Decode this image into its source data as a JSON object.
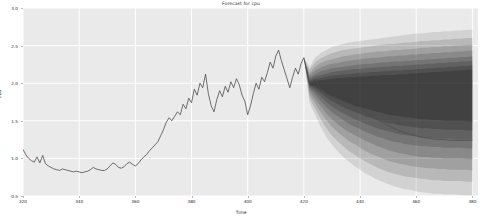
{
  "chart_data": {
    "type": "line",
    "title": "Forecast for cpu",
    "xlabel": "Time",
    "ylabel": "cpu",
    "xlim": [
      320,
      482
    ],
    "ylim": [
      0.5,
      3.0
    ],
    "xticks": [
      320,
      340,
      360,
      380,
      400,
      420,
      440,
      460,
      480
    ],
    "xticklabels": [
      "320",
      "340",
      "360",
      "380",
      "400",
      "420",
      "440",
      "460",
      "480"
    ],
    "yticks": [
      0.5,
      1.0,
      1.5,
      2.0,
      2.5,
      3.0
    ],
    "yticklabels": [
      "0.5",
      "1.0",
      "1.5",
      "2.0",
      "2.5",
      "3.0"
    ],
    "grid": true,
    "legend": "none",
    "forecast_start": 420,
    "series": [
      {
        "name": "history",
        "color": "#4d4d4d",
        "x": [
          320,
          321,
          322,
          323,
          324,
          325,
          326,
          327,
          328,
          329,
          330,
          331,
          332,
          333,
          334,
          335,
          336,
          337,
          338,
          339,
          340,
          341,
          342,
          343,
          344,
          345,
          346,
          347,
          348,
          349,
          350,
          351,
          352,
          353,
          354,
          355,
          356,
          357,
          358,
          359,
          360,
          361,
          362,
          363,
          364,
          365,
          366,
          367,
          368,
          369,
          370,
          371,
          372,
          373,
          374,
          375,
          376,
          377,
          378,
          379,
          380,
          381,
          382,
          383,
          384,
          385,
          386,
          387,
          388,
          389,
          390,
          391,
          392,
          393,
          394,
          395,
          396,
          397,
          398,
          399,
          400,
          401,
          402,
          403,
          404,
          405,
          406,
          407,
          408,
          409,
          410,
          411,
          412,
          413,
          414,
          415,
          416,
          417,
          418,
          419,
          420
        ],
        "values": [
          1.12,
          1.05,
          1.0,
          0.97,
          0.95,
          1.02,
          0.94,
          1.04,
          0.93,
          0.9,
          0.88,
          0.86,
          0.85,
          0.84,
          0.86,
          0.85,
          0.84,
          0.83,
          0.82,
          0.83,
          0.82,
          0.81,
          0.82,
          0.83,
          0.85,
          0.88,
          0.86,
          0.85,
          0.84,
          0.84,
          0.86,
          0.9,
          0.94,
          0.92,
          0.88,
          0.87,
          0.89,
          0.93,
          0.95,
          0.92,
          0.9,
          0.93,
          0.98,
          1.02,
          1.05,
          1.1,
          1.14,
          1.18,
          1.22,
          1.3,
          1.38,
          1.48,
          1.54,
          1.5,
          1.56,
          1.62,
          1.58,
          1.72,
          1.66,
          1.8,
          1.74,
          1.92,
          1.84,
          2.0,
          1.94,
          2.12,
          1.86,
          1.7,
          1.62,
          1.78,
          1.9,
          1.82,
          1.96,
          1.88,
          2.02,
          1.94,
          2.06,
          1.98,
          1.84,
          1.76,
          1.58,
          1.7,
          1.86,
          2.0,
          1.92,
          2.08,
          2.02,
          2.14,
          2.28,
          2.2,
          2.36,
          2.44,
          2.3,
          2.18,
          2.06,
          1.94,
          2.08,
          2.2,
          2.12,
          2.26,
          2.34
        ]
      },
      {
        "name": "forecast-median",
        "color": "#4d4d4d",
        "x": [
          420,
          422,
          424,
          426,
          428,
          430,
          432,
          434,
          436,
          438,
          440,
          442,
          444,
          446,
          448,
          450,
          452,
          454,
          456,
          458,
          460,
          462,
          464,
          466,
          468,
          470,
          472,
          474,
          476,
          478,
          480
        ],
        "values": [
          2.34,
          1.98,
          2.05,
          1.92,
          1.86,
          1.82,
          1.8,
          1.76,
          1.73,
          1.7,
          1.66,
          1.62,
          1.57,
          1.52,
          1.48,
          1.44,
          1.4,
          1.37,
          1.34,
          1.32,
          1.3,
          1.28,
          1.27,
          1.26,
          1.25,
          1.25,
          1.24,
          1.24,
          1.24,
          1.24,
          1.24
        ]
      }
    ],
    "confidence_bands": [
      {
        "name": "band-95",
        "opacity": 0.1,
        "lower": [
          2.34,
          1.74,
          1.58,
          1.42,
          1.28,
          1.18,
          1.1,
          1.02,
          0.96,
          0.9,
          0.85,
          0.8,
          0.76,
          0.72,
          0.69,
          0.66,
          0.63,
          0.61,
          0.59,
          0.58,
          0.56,
          0.55,
          0.54,
          0.53,
          0.53,
          0.52,
          0.52,
          0.52,
          0.51,
          0.51,
          0.51
        ],
        "upper": [
          2.34,
          2.22,
          2.34,
          2.4,
          2.44,
          2.48,
          2.5,
          2.52,
          2.54,
          2.55,
          2.56,
          2.57,
          2.58,
          2.59,
          2.6,
          2.61,
          2.62,
          2.63,
          2.64,
          2.65,
          2.66,
          2.66,
          2.67,
          2.68,
          2.68,
          2.69,
          2.69,
          2.7,
          2.7,
          2.71,
          2.71
        ]
      },
      {
        "name": "band-85",
        "opacity": 0.12,
        "lower": [
          2.34,
          1.8,
          1.66,
          1.52,
          1.4,
          1.3,
          1.23,
          1.16,
          1.1,
          1.05,
          1.0,
          0.96,
          0.92,
          0.88,
          0.85,
          0.82,
          0.8,
          0.78,
          0.76,
          0.75,
          0.74,
          0.73,
          0.72,
          0.71,
          0.71,
          0.7,
          0.7,
          0.7,
          0.7,
          0.69,
          0.69
        ],
        "upper": [
          2.34,
          2.18,
          2.28,
          2.33,
          2.37,
          2.4,
          2.42,
          2.44,
          2.45,
          2.46,
          2.47,
          2.48,
          2.49,
          2.5,
          2.51,
          2.52,
          2.52,
          2.53,
          2.54,
          2.54,
          2.55,
          2.56,
          2.56,
          2.57,
          2.57,
          2.58,
          2.58,
          2.59,
          2.59,
          2.6,
          2.6
        ]
      },
      {
        "name": "band-75",
        "opacity": 0.13,
        "lower": [
          2.34,
          1.85,
          1.73,
          1.61,
          1.51,
          1.42,
          1.35,
          1.29,
          1.23,
          1.19,
          1.14,
          1.1,
          1.06,
          1.03,
          1.0,
          0.97,
          0.95,
          0.93,
          0.92,
          0.9,
          0.89,
          0.88,
          0.87,
          0.87,
          0.86,
          0.86,
          0.85,
          0.85,
          0.85,
          0.85,
          0.84
        ],
        "upper": [
          2.34,
          2.14,
          2.22,
          2.27,
          2.3,
          2.32,
          2.34,
          2.36,
          2.37,
          2.38,
          2.39,
          2.4,
          2.41,
          2.42,
          2.42,
          2.43,
          2.44,
          2.44,
          2.45,
          2.45,
          2.46,
          2.47,
          2.47,
          2.48,
          2.48,
          2.49,
          2.49,
          2.5,
          2.5,
          2.51,
          2.51
        ]
      },
      {
        "name": "band-65",
        "opacity": 0.14,
        "lower": [
          2.34,
          1.89,
          1.79,
          1.69,
          1.6,
          1.52,
          1.46,
          1.4,
          1.35,
          1.31,
          1.27,
          1.23,
          1.2,
          1.16,
          1.14,
          1.11,
          1.09,
          1.07,
          1.06,
          1.04,
          1.03,
          1.02,
          1.02,
          1.01,
          1.01,
          1.0,
          1.0,
          1.0,
          1.0,
          0.99,
          0.99
        ],
        "upper": [
          2.34,
          2.11,
          2.17,
          2.21,
          2.24,
          2.26,
          2.27,
          2.29,
          2.3,
          2.31,
          2.32,
          2.33,
          2.34,
          2.34,
          2.35,
          2.36,
          2.36,
          2.37,
          2.37,
          2.38,
          2.38,
          2.39,
          2.39,
          2.4,
          2.4,
          2.41,
          2.41,
          2.42,
          2.42,
          2.43,
          2.43
        ]
      },
      {
        "name": "band-55",
        "opacity": 0.15,
        "lower": [
          2.34,
          1.93,
          1.85,
          1.76,
          1.68,
          1.61,
          1.56,
          1.51,
          1.46,
          1.42,
          1.39,
          1.35,
          1.32,
          1.29,
          1.27,
          1.24,
          1.22,
          1.21,
          1.19,
          1.18,
          1.17,
          1.16,
          1.16,
          1.15,
          1.15,
          1.14,
          1.14,
          1.14,
          1.14,
          1.13,
          1.13
        ],
        "upper": [
          2.34,
          2.08,
          2.12,
          2.16,
          2.18,
          2.2,
          2.21,
          2.22,
          2.23,
          2.24,
          2.25,
          2.26,
          2.26,
          2.27,
          2.28,
          2.28,
          2.29,
          2.29,
          2.3,
          2.3,
          2.31,
          2.31,
          2.32,
          2.32,
          2.33,
          2.33,
          2.34,
          2.34,
          2.35,
          2.35,
          2.36
        ]
      },
      {
        "name": "band-45",
        "opacity": 0.16,
        "lower": [
          2.34,
          1.95,
          1.89,
          1.82,
          1.75,
          1.69,
          1.64,
          1.6,
          1.56,
          1.52,
          1.49,
          1.46,
          1.43,
          1.4,
          1.38,
          1.36,
          1.34,
          1.32,
          1.31,
          1.3,
          1.29,
          1.28,
          1.27,
          1.27,
          1.26,
          1.26,
          1.26,
          1.25,
          1.25,
          1.25,
          1.25
        ],
        "upper": [
          2.34,
          2.05,
          2.09,
          2.11,
          2.13,
          2.15,
          2.16,
          2.17,
          2.18,
          2.19,
          2.19,
          2.2,
          2.21,
          2.21,
          2.22,
          2.22,
          2.23,
          2.23,
          2.24,
          2.24,
          2.25,
          2.25,
          2.26,
          2.26,
          2.27,
          2.27,
          2.28,
          2.28,
          2.29,
          2.29,
          2.3
        ]
      },
      {
        "name": "band-35",
        "opacity": 0.17,
        "lower": [
          2.34,
          1.97,
          1.93,
          1.87,
          1.81,
          1.76,
          1.72,
          1.68,
          1.65,
          1.62,
          1.59,
          1.56,
          1.54,
          1.51,
          1.49,
          1.47,
          1.46,
          1.44,
          1.43,
          1.42,
          1.41,
          1.4,
          1.4,
          1.39,
          1.39,
          1.38,
          1.38,
          1.38,
          1.38,
          1.37,
          1.37
        ],
        "upper": [
          2.34,
          2.03,
          2.06,
          2.07,
          2.09,
          2.1,
          2.11,
          2.12,
          2.12,
          2.13,
          2.14,
          2.14,
          2.15,
          2.15,
          2.16,
          2.16,
          2.17,
          2.17,
          2.18,
          2.18,
          2.19,
          2.19,
          2.2,
          2.2,
          2.21,
          2.21,
          2.22,
          2.22,
          2.23,
          2.23,
          2.24
        ]
      },
      {
        "name": "band-25",
        "opacity": 0.18,
        "lower": [
          2.34,
          1.98,
          1.96,
          1.91,
          1.86,
          1.82,
          1.79,
          1.76,
          1.73,
          1.7,
          1.68,
          1.66,
          1.64,
          1.62,
          1.6,
          1.58,
          1.57,
          1.56,
          1.55,
          1.54,
          1.53,
          1.52,
          1.52,
          1.51,
          1.51,
          1.5,
          1.5,
          1.5,
          1.5,
          1.49,
          1.49
        ],
        "upper": [
          2.34,
          2.01,
          2.03,
          2.04,
          2.05,
          2.06,
          2.07,
          2.07,
          2.08,
          2.08,
          2.09,
          2.09,
          2.1,
          2.1,
          2.11,
          2.11,
          2.11,
          2.12,
          2.12,
          2.13,
          2.13,
          2.14,
          2.14,
          2.15,
          2.15,
          2.16,
          2.16,
          2.17,
          2.17,
          2.18,
          2.18
        ]
      }
    ]
  }
}
